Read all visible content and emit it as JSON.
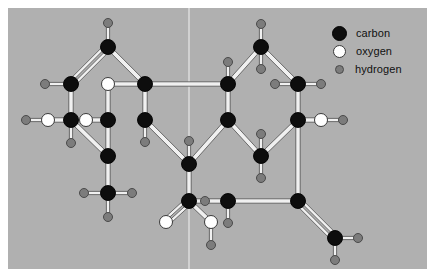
{
  "figure": {
    "background_color": "#b0b0b0",
    "frame_color": "#ffffff",
    "panel": {
      "x": 8,
      "y": 8,
      "width": 419,
      "height": 261
    }
  },
  "legend": {
    "position": "top-right",
    "items": [
      {
        "key": "carbon",
        "label": "carbon",
        "color": "#0d0d0d",
        "radius": 7.5
      },
      {
        "key": "oxygen",
        "label": "oxygen",
        "color": "#ffffff",
        "radius": 6.5
      },
      {
        "key": "hydrogen",
        "label": "hydrogen",
        "color": "#7c7c7c",
        "radius": 4.5
      }
    ]
  },
  "colors": {
    "carbon": "#0d0d0d",
    "oxygen": "#ffffff",
    "hydrogen": "#7c7c7c",
    "carbon_stroke": "#000000",
    "oxygen_stroke": "#3a3a3a",
    "hydrogen_stroke": "#4a4a4a",
    "bond_fill": "#f0f0f0",
    "bond_stroke": "#4f4f4f",
    "divider": "#e8e8e8",
    "background": "#b0b0b0"
  },
  "guides": [
    {
      "name": "vertical-divider",
      "x1": 181,
      "y1": 0,
      "x2": 181,
      "y2": 261
    }
  ],
  "chart_data": {
    "type": "diagram",
    "subtype": "ball-and-stick molecular structure",
    "atom_counts": {
      "carbon": 19,
      "oxygen": 6,
      "hydrogen": 26
    },
    "atoms": [
      {
        "id": "C1",
        "element": "carbon",
        "x": 100,
        "y": 39
      },
      {
        "id": "H1",
        "element": "hydrogen",
        "x": 100,
        "y": 15
      },
      {
        "id": "C2",
        "element": "carbon",
        "x": 63,
        "y": 76
      },
      {
        "id": "H2",
        "element": "hydrogen",
        "x": 37,
        "y": 76
      },
      {
        "id": "C3",
        "element": "carbon",
        "x": 63,
        "y": 112
      },
      {
        "id": "O1",
        "element": "oxygen",
        "x": 40,
        "y": 112
      },
      {
        "id": "H3",
        "element": "hydrogen",
        "x": 18,
        "y": 112
      },
      {
        "id": "H4",
        "element": "hydrogen",
        "x": 63,
        "y": 135
      },
      {
        "id": "C4",
        "element": "carbon",
        "x": 100,
        "y": 148
      },
      {
        "id": "O2",
        "element": "oxygen",
        "x": 100,
        "y": 76
      },
      {
        "id": "C5",
        "element": "carbon",
        "x": 100,
        "y": 112
      },
      {
        "id": "O3",
        "element": "oxygen",
        "x": 78,
        "y": 112
      },
      {
        "id": "C6",
        "element": "carbon",
        "x": 137,
        "y": 76
      },
      {
        "id": "C7",
        "element": "carbon",
        "x": 137,
        "y": 112
      },
      {
        "id": "H5",
        "element": "hydrogen",
        "x": 137,
        "y": 134
      },
      {
        "id": "C8",
        "element": "carbon",
        "x": 100,
        "y": 185
      },
      {
        "id": "H6",
        "element": "hydrogen",
        "x": 76,
        "y": 185
      },
      {
        "id": "H7",
        "element": "hydrogen",
        "x": 124,
        "y": 185
      },
      {
        "id": "H8",
        "element": "hydrogen",
        "x": 100,
        "y": 209
      },
      {
        "id": "C9",
        "element": "carbon",
        "x": 181,
        "y": 156
      },
      {
        "id": "H9",
        "element": "hydrogen",
        "x": 181,
        "y": 133
      },
      {
        "id": "C10",
        "element": "carbon",
        "x": 181,
        "y": 193
      },
      {
        "id": "O4",
        "element": "oxygen",
        "x": 158,
        "y": 214
      },
      {
        "id": "O5",
        "element": "oxygen",
        "x": 203,
        "y": 214
      },
      {
        "id": "H10",
        "element": "hydrogen",
        "x": 203,
        "y": 237
      },
      {
        "id": "C11",
        "element": "carbon",
        "x": 220,
        "y": 76
      },
      {
        "id": "H11",
        "element": "hydrogen",
        "x": 220,
        "y": 54
      },
      {
        "id": "C12",
        "element": "carbon",
        "x": 220,
        "y": 112
      },
      {
        "id": "C13",
        "element": "carbon",
        "x": 253,
        "y": 39
      },
      {
        "id": "H12",
        "element": "hydrogen",
        "x": 253,
        "y": 16
      },
      {
        "id": "H13",
        "element": "hydrogen",
        "x": 253,
        "y": 61
      },
      {
        "id": "C14",
        "element": "carbon",
        "x": 290,
        "y": 76
      },
      {
        "id": "H14",
        "element": "hydrogen",
        "x": 267,
        "y": 76
      },
      {
        "id": "H15",
        "element": "hydrogen",
        "x": 313,
        "y": 76
      },
      {
        "id": "C15",
        "element": "carbon",
        "x": 290,
        "y": 112
      },
      {
        "id": "O6",
        "element": "oxygen",
        "x": 313,
        "y": 112
      },
      {
        "id": "H16",
        "element": "hydrogen",
        "x": 335,
        "y": 112
      },
      {
        "id": "C16",
        "element": "carbon",
        "x": 253,
        "y": 148
      },
      {
        "id": "H17",
        "element": "hydrogen",
        "x": 253,
        "y": 126
      },
      {
        "id": "H18",
        "element": "hydrogen",
        "x": 253,
        "y": 170
      },
      {
        "id": "C17",
        "element": "carbon",
        "x": 220,
        "y": 193
      },
      {
        "id": "H19",
        "element": "hydrogen",
        "x": 197,
        "y": 193
      },
      {
        "id": "H20",
        "element": "hydrogen",
        "x": 220,
        "y": 215
      },
      {
        "id": "C18",
        "element": "carbon",
        "x": 290,
        "y": 193
      },
      {
        "id": "C19",
        "element": "carbon",
        "x": 327,
        "y": 230
      },
      {
        "id": "H21",
        "element": "hydrogen",
        "x": 350,
        "y": 230
      },
      {
        "id": "H22",
        "element": "hydrogen",
        "x": 327,
        "y": 252
      }
    ],
    "bonds": [
      {
        "a": "C1",
        "b": "H1",
        "order": 1
      },
      {
        "a": "C1",
        "b": "C2",
        "order": 2
      },
      {
        "a": "C1",
        "b": "C6",
        "order": 1
      },
      {
        "a": "C2",
        "b": "H2",
        "order": 1
      },
      {
        "a": "C2",
        "b": "C3",
        "order": 1
      },
      {
        "a": "C3",
        "b": "O1",
        "order": 1
      },
      {
        "a": "O1",
        "b": "H3",
        "order": 1
      },
      {
        "a": "C3",
        "b": "H4",
        "order": 1
      },
      {
        "a": "C3",
        "b": "C4",
        "order": 1
      },
      {
        "a": "O2",
        "b": "C5",
        "order": 1
      },
      {
        "a": "O2",
        "b": "C6",
        "order": 1
      },
      {
        "a": "C5",
        "b": "O3",
        "order": 1
      },
      {
        "a": "C5",
        "b": "C4",
        "order": 1
      },
      {
        "a": "C6",
        "b": "C7",
        "order": 1
      },
      {
        "a": "C7",
        "b": "H5",
        "order": 1
      },
      {
        "a": "C7",
        "b": "C9",
        "order": 1
      },
      {
        "a": "C4",
        "b": "C8",
        "order": 1
      },
      {
        "a": "C8",
        "b": "H6",
        "order": 1
      },
      {
        "a": "C8",
        "b": "H7",
        "order": 1
      },
      {
        "a": "C8",
        "b": "H8",
        "order": 1
      },
      {
        "a": "C9",
        "b": "H9",
        "order": 1
      },
      {
        "a": "C9",
        "b": "C10",
        "order": 1
      },
      {
        "a": "C10",
        "b": "O4",
        "order": 2
      },
      {
        "a": "C10",
        "b": "O5",
        "order": 1
      },
      {
        "a": "O5",
        "b": "H10",
        "order": 1
      },
      {
        "a": "C6",
        "b": "C11",
        "order": 1
      },
      {
        "a": "C11",
        "b": "H11",
        "order": 1
      },
      {
        "a": "C11",
        "b": "C13",
        "order": 1
      },
      {
        "a": "C11",
        "b": "C12",
        "order": 1
      },
      {
        "a": "C12",
        "b": "C9",
        "order": 1
      },
      {
        "a": "C12",
        "b": "C16",
        "order": 1
      },
      {
        "a": "C13",
        "b": "H12",
        "order": 1
      },
      {
        "a": "C13",
        "b": "H13",
        "order": 1
      },
      {
        "a": "C13",
        "b": "C14",
        "order": 1
      },
      {
        "a": "C14",
        "b": "H14",
        "order": 1
      },
      {
        "a": "C14",
        "b": "H15",
        "order": 1
      },
      {
        "a": "C14",
        "b": "C15",
        "order": 1
      },
      {
        "a": "C15",
        "b": "O6",
        "order": 1
      },
      {
        "a": "O6",
        "b": "H16",
        "order": 1
      },
      {
        "a": "C15",
        "b": "C16",
        "order": 1
      },
      {
        "a": "C15",
        "b": "C18",
        "order": 1
      },
      {
        "a": "C16",
        "b": "H17",
        "order": 1
      },
      {
        "a": "C16",
        "b": "H18",
        "order": 1
      },
      {
        "a": "C17",
        "b": "H19",
        "order": 1
      },
      {
        "a": "C17",
        "b": "H20",
        "order": 1
      },
      {
        "a": "C17",
        "b": "C10",
        "order": 1
      },
      {
        "a": "C17",
        "b": "C18",
        "order": 1
      },
      {
        "a": "C18",
        "b": "C19",
        "order": 2
      },
      {
        "a": "C19",
        "b": "H21",
        "order": 1
      },
      {
        "a": "C19",
        "b": "H22",
        "order": 1
      }
    ]
  }
}
